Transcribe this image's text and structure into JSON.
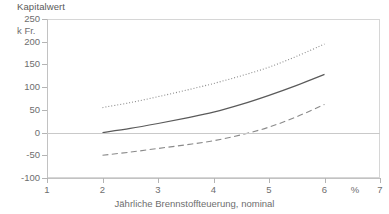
{
  "chart_data": {
    "type": "line",
    "title": "Kapitalwert",
    "xlabel": "Jährliche Brennstoffteuerung, nominal",
    "ylabel": "Kapitalwert",
    "yunit": "k Fr.",
    "xunit": "%",
    "xlim": [
      1,
      7
    ],
    "ylim": [
      -100,
      250
    ],
    "grid": false,
    "legend": "none",
    "zero_line": true,
    "x_ticks": [
      "1",
      "2",
      "3",
      "4",
      "5",
      "6",
      "7"
    ],
    "x_tick_values": [
      1,
      2,
      3,
      4,
      5,
      6,
      7
    ],
    "y_ticks": [
      "250",
      "200",
      "150",
      "100",
      "50",
      "0",
      "-50",
      "-100"
    ],
    "y_tick_values": [
      250,
      200,
      150,
      100,
      50,
      0,
      -50,
      -100
    ],
    "x": [
      2,
      2.5,
      3,
      3.5,
      4,
      4.5,
      5,
      5.5,
      6
    ],
    "series": [
      {
        "name": "upper",
        "style": "dotted",
        "color": "#8a8a8a",
        "values": [
          55,
          66,
          79,
          93,
          108,
          125,
          144,
          168,
          195
        ]
      },
      {
        "name": "middle",
        "style": "solid",
        "color": "#5a5a5a",
        "values": [
          0,
          9,
          20,
          32,
          45,
          62,
          82,
          104,
          128
        ]
      },
      {
        "name": "lower",
        "style": "dashed",
        "color": "#8a8a8a",
        "values": [
          -50,
          -43,
          -35,
          -27,
          -18,
          -5,
          12,
          35,
          62
        ]
      }
    ]
  },
  "colors": {
    "frame": "#d6d6d6",
    "axis": "#c2c2c2",
    "tick": "#b4b4b4",
    "text": "#6e6e6e",
    "zero": "#c9c9c9"
  }
}
